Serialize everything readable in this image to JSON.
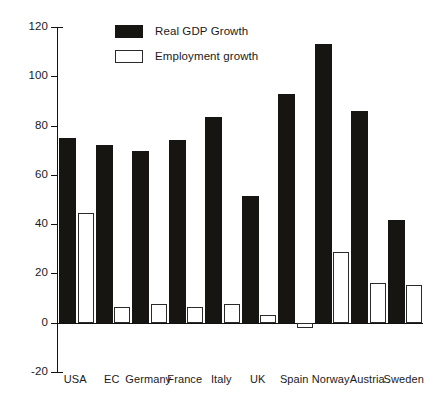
{
  "chart_data": {
    "type": "bar",
    "title": "",
    "xlabel": "",
    "ylabel": "",
    "ylim": [
      -20,
      120
    ],
    "yticks": [
      -20,
      0,
      20,
      40,
      60,
      80,
      100,
      120
    ],
    "grid": false,
    "legend_position": "top-left-inside",
    "categories": [
      "USA",
      "EC",
      "Germany",
      "France",
      "Italy",
      "UK",
      "Spain",
      "Norway",
      "Austria",
      "Sweden"
    ],
    "series": [
      {
        "name": "Real GDP Growth",
        "color": "#171512",
        "values": [
          75,
          72,
          69.5,
          74,
          83.5,
          51.5,
          93,
          113,
          86,
          41.5
        ]
      },
      {
        "name": "Employment growth",
        "color": "#ffffff",
        "values": [
          44.5,
          6.5,
          7.5,
          6.5,
          7.5,
          3,
          -2,
          28.5,
          16,
          15.5
        ]
      }
    ]
  },
  "legend": {
    "items": [
      {
        "label": "Real GDP Growth",
        "swatch": "filled-black"
      },
      {
        "label": "Employment growth",
        "swatch": "outlined-white"
      }
    ]
  },
  "axis": {
    "y_tick_labels": [
      "120",
      "100",
      "80",
      "60",
      "40",
      "20",
      "0",
      "-20"
    ]
  },
  "caption": {
    "text": ""
  },
  "colors": {
    "gdp_bar": "#171512",
    "employment_bar": "#ffffff",
    "axis": "#111111",
    "background": "#ffffff"
  }
}
